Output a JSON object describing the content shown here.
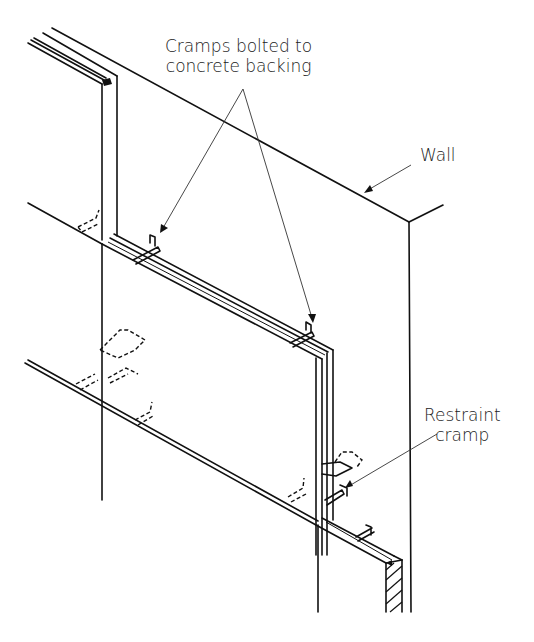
{
  "diagram": {
    "type": "isometric technical line drawing",
    "labels": {
      "cramps": {
        "line1": "Cramps bolted to",
        "line2": "concrete backing"
      },
      "wall": "Wall",
      "restraint": {
        "line1": "Restraint",
        "line2": "cramp"
      }
    },
    "colors": {
      "ink": "#111111",
      "background": "#ffffff"
    }
  }
}
